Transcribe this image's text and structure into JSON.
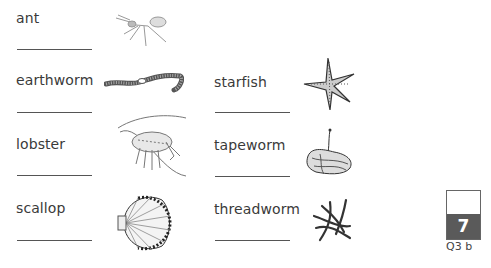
{
  "worksheet": {
    "items": [
      {
        "word": "ant",
        "image": "ant-illustration"
      },
      {
        "word": "earthworm",
        "image": "earthworm-illustration"
      },
      {
        "word": "lobster",
        "image": "lobster-illustration"
      },
      {
        "word": "scallop",
        "image": "scallop-illustration"
      },
      {
        "word": "starfish",
        "image": "starfish-illustration"
      },
      {
        "word": "tapeworm",
        "image": "tapeworm-illustration"
      },
      {
        "word": "threadworm",
        "image": "threadworm-illustration"
      }
    ],
    "answer_lines": [
      "",
      "",
      "",
      "",
      "",
      "",
      ""
    ]
  },
  "mark_box": {
    "marks": "7",
    "question_ref": "Q3 b",
    "colors": {
      "fill": "#5a5a5a",
      "border": "#666666",
      "text": "#ffffff"
    }
  }
}
